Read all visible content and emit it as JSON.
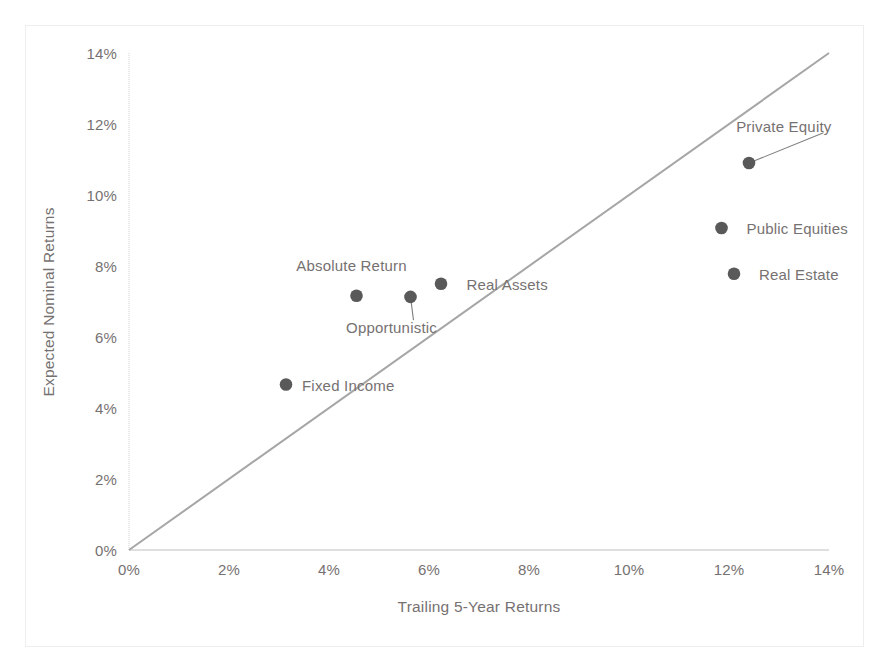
{
  "chart_data": {
    "type": "scatter",
    "title": "",
    "xlabel": "Trailing 5-Year Returns",
    "ylabel": "Expected Nominal Returns",
    "xlim": [
      0,
      14
    ],
    "ylim": [
      0,
      14
    ],
    "x_ticks": [
      "0%",
      "2%",
      "4%",
      "6%",
      "8%",
      "10%",
      "12%",
      "14%"
    ],
    "y_ticks": [
      "0%",
      "2%",
      "4%",
      "6%",
      "8%",
      "10%",
      "12%",
      "14%"
    ],
    "x_tick_values": [
      0,
      2,
      4,
      6,
      8,
      10,
      12,
      14
    ],
    "y_tick_values": [
      0,
      2,
      4,
      6,
      8,
      10,
      12,
      14
    ],
    "grid": false,
    "legend": "none",
    "annotations": [
      {
        "name": "identity-line",
        "description": "45-degree reference line from (0%, 0%) to (14%, 14%)",
        "from": [
          0,
          0
        ],
        "to": [
          14,
          14
        ],
        "color": "#a6a6a6"
      }
    ],
    "marker_color": "#595959",
    "points": [
      {
        "label": "Private Equity",
        "x": 12.4,
        "y": 10.9,
        "label_x": 14.05,
        "label_y": 11.95,
        "anchor": "end",
        "leader": true
      },
      {
        "label": "Public Equities",
        "x": 11.85,
        "y": 9.07,
        "label_x": 12.35,
        "label_y": 9.07,
        "anchor": "start",
        "leader": false
      },
      {
        "label": "Real Estate",
        "x": 12.1,
        "y": 7.78,
        "label_x": 12.6,
        "label_y": 7.78,
        "anchor": "start",
        "leader": false
      },
      {
        "label": "Real Assets",
        "x": 6.24,
        "y": 7.5,
        "label_x": 6.75,
        "label_y": 7.5,
        "anchor": "start",
        "leader": false
      },
      {
        "label": "Absolute Return",
        "x": 4.55,
        "y": 7.16,
        "label_x": 4.45,
        "label_y": 8.02,
        "anchor": "mid",
        "leader": false
      },
      {
        "label": "Opportunistic",
        "x": 5.63,
        "y": 7.13,
        "label_x": 5.25,
        "label_y": 6.28,
        "anchor": "mid",
        "leader": true
      },
      {
        "label": "Fixed Income",
        "x": 3.14,
        "y": 4.66,
        "label_x": 3.46,
        "label_y": 4.66,
        "anchor": "start",
        "leader": false
      }
    ]
  }
}
